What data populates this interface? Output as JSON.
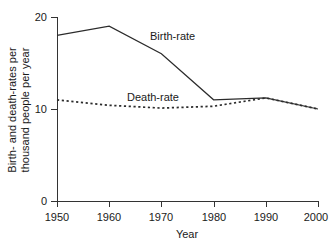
{
  "chart_data": {
    "type": "line",
    "title": "",
    "xlabel": "Year",
    "ylabel_line1": "Birth- and death-rates per",
    "ylabel_line2": "thousand people per year",
    "x": [
      1950,
      1960,
      1970,
      1980,
      1990,
      2000
    ],
    "xlim": [
      1950,
      2000
    ],
    "ylim": [
      0,
      20
    ],
    "x_tick_labels": [
      "1950",
      "1960",
      "1970",
      "1980",
      "1990",
      "2000"
    ],
    "y_tick_values": [
      0,
      10,
      20
    ],
    "y_tick_labels": [
      "0",
      "10",
      "20"
    ],
    "grid": false,
    "legend": "inline-annotations",
    "series": [
      {
        "name": "Birth-rate",
        "style": "solid",
        "color": "#2b2b2b",
        "annotation": "Birth-rate",
        "values": [
          18.0,
          19.0,
          16.0,
          11.0,
          11.2,
          10.0
        ]
      },
      {
        "name": "Death-rate",
        "style": "dotted",
        "color": "#2b2b2b",
        "annotation": "Death-rate",
        "values": [
          11.0,
          10.4,
          10.1,
          10.3,
          11.2,
          10.0
        ]
      }
    ],
    "annotations": [
      {
        "text": "Birth-rate",
        "x_px": 150,
        "y_px": 40
      },
      {
        "text": "Death-rate",
        "x_px": 127,
        "y_px": 101
      }
    ]
  }
}
